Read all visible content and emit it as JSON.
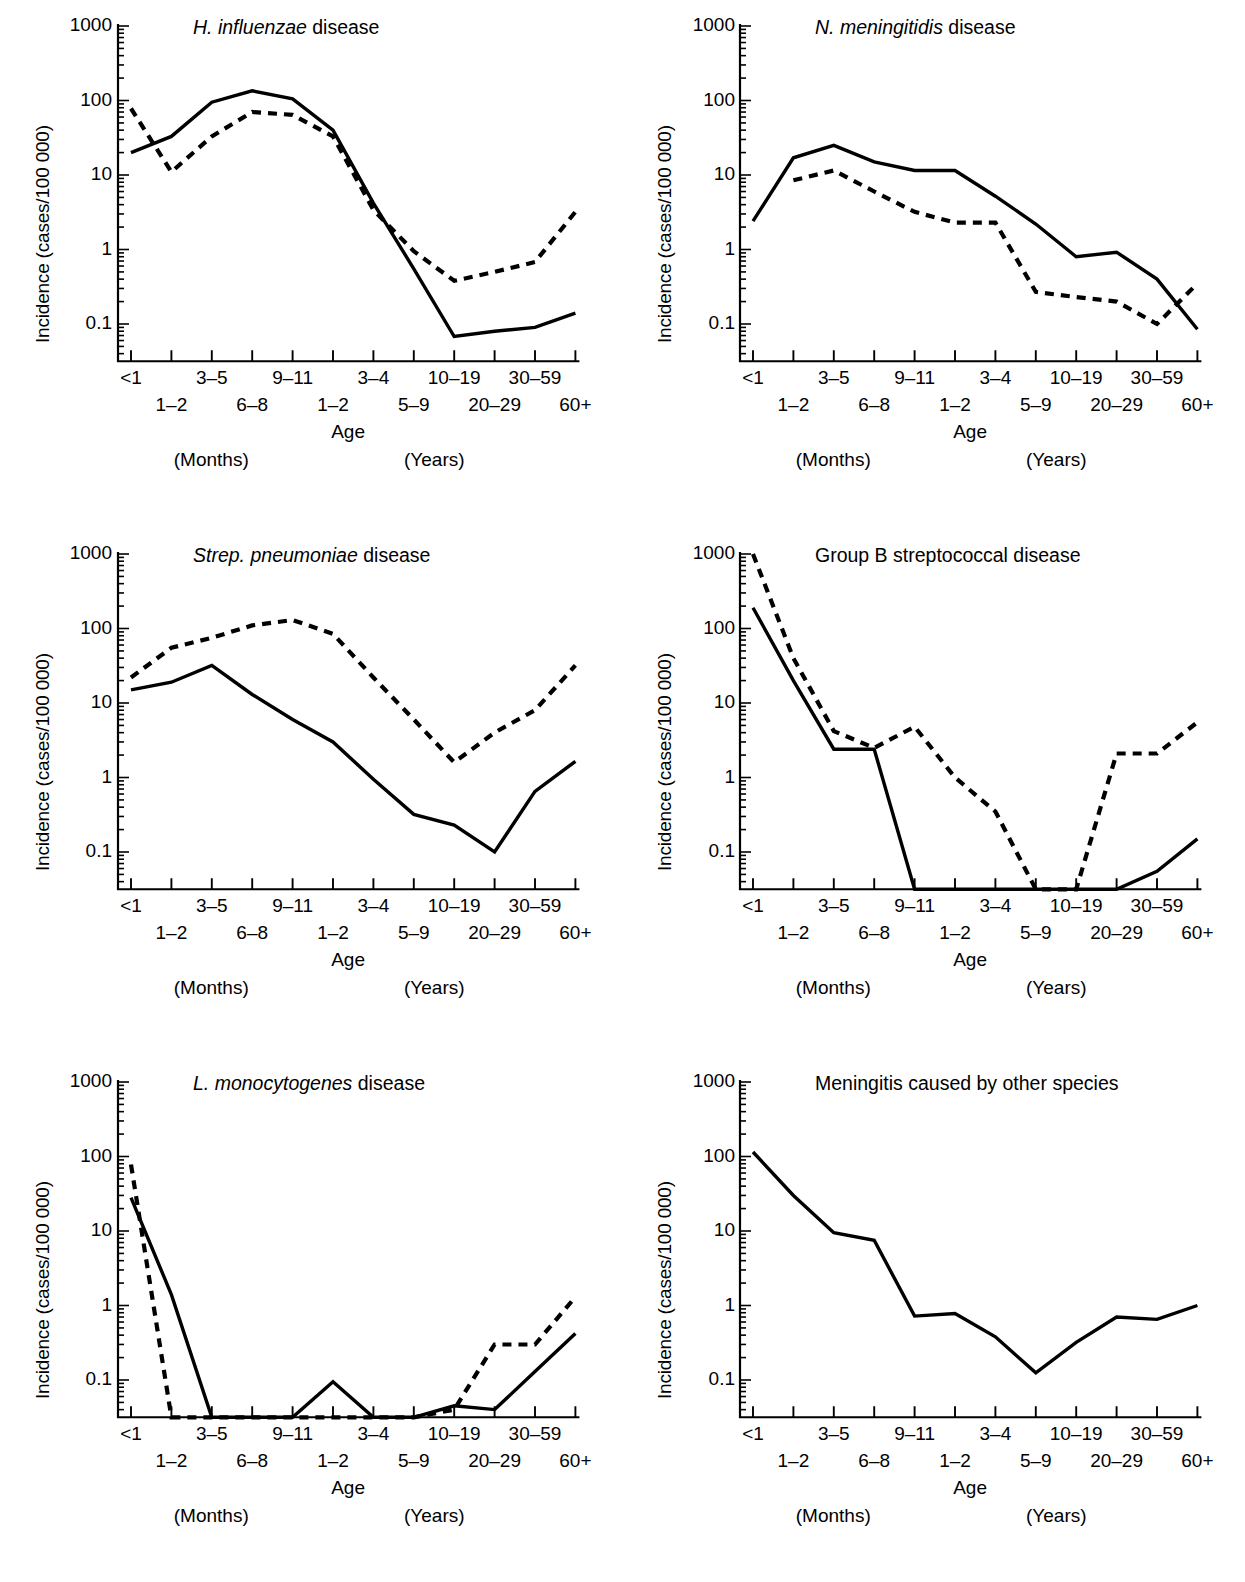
{
  "figure": {
    "axis_label_y": "Incidence (cases/100 000)",
    "axis_label_x": "Age",
    "months_note": "(Months)",
    "years_note": "(Years)",
    "y_tick_labels": [
      "1000",
      "100",
      "10",
      "1",
      "0.1"
    ],
    "x_tick_labels_top": [
      "<1",
      "3–5",
      "9–11",
      "3–4",
      "10–19",
      "30–59"
    ],
    "x_tick_labels_bottom": [
      "1–2",
      "6–8",
      "1–2",
      "5–9",
      "20–29",
      "60+"
    ],
    "line_color": "#000000",
    "solid_series_name": "solid",
    "dashed_series_name": "dashed"
  },
  "chart_data": [
    {
      "type": "line",
      "title": "H. influenzae disease",
      "title_italic_part": "H. influenzae",
      "title_roman_part": " disease",
      "xlabel": "Age",
      "ylabel": "Incidence (cases/100 000)",
      "ylim": [
        0.032,
        1000
      ],
      "yscale": "log",
      "grid": false,
      "legend": "none",
      "categories": [
        "<1",
        "1–2",
        "3–5",
        "6–8",
        "9–11",
        "1–2",
        "3–4",
        "5–9",
        "10–19",
        "20–29",
        "30–59",
        "60+"
      ],
      "series": [
        {
          "name": "solid",
          "style": "solid",
          "values": [
            20,
            33,
            95,
            135,
            105,
            40,
            4.2,
            0.55,
            0.068,
            0.08,
            0.09,
            0.14
          ]
        },
        {
          "name": "dashed",
          "style": "dashed",
          "values": [
            78,
            11,
            33,
            70,
            64,
            33,
            3.4,
            0.95,
            0.38,
            0.5,
            0.68,
            3.2
          ]
        }
      ]
    },
    {
      "type": "line",
      "title": "N. meningitidis disease",
      "title_italic_part": "N. meningitidis",
      "title_roman_part": " disease",
      "xlabel": "Age",
      "ylabel": "Incidence (cases/100 000)",
      "ylim": [
        0.032,
        1000
      ],
      "yscale": "log",
      "grid": false,
      "legend": "none",
      "categories": [
        "<1",
        "1–2",
        "3–5",
        "6–8",
        "9–11",
        "1–2",
        "3–4",
        "5–9",
        "10–19",
        "20–29",
        "30–59",
        "60+"
      ],
      "series": [
        {
          "name": "solid",
          "style": "solid",
          "values": [
            2.4,
            17,
            25,
            15,
            11.5,
            11.5,
            5.2,
            2.2,
            0.8,
            0.92,
            0.4,
            0.085
          ]
        },
        {
          "name": "dashed",
          "style": "dashed",
          "values": [
            null,
            8.5,
            11.5,
            6.0,
            3.2,
            2.3,
            2.3,
            0.27,
            0.23,
            0.2,
            0.1,
            0.35
          ]
        }
      ]
    },
    {
      "type": "line",
      "title": "Strep. pneumoniae disease",
      "title_italic_part": "Strep. pneumoniae",
      "title_roman_part": " disease",
      "xlabel": "Age",
      "ylabel": "Incidence (cases/100 000)",
      "ylim": [
        0.032,
        1000
      ],
      "yscale": "log",
      "grid": false,
      "legend": "none",
      "categories": [
        "<1",
        "1–2",
        "3–5",
        "6–8",
        "9–11",
        "1–2",
        "3–4",
        "5–9",
        "10–19",
        "20–29",
        "30–59",
        "60+"
      ],
      "series": [
        {
          "name": "solid",
          "style": "solid",
          "values": [
            15,
            19,
            32,
            13,
            6.0,
            3.0,
            0.95,
            0.32,
            0.23,
            0.1,
            0.65,
            1.65
          ]
        },
        {
          "name": "dashed",
          "style": "dashed",
          "values": [
            22,
            55,
            75,
            110,
            130,
            85,
            22,
            6.0,
            1.6,
            4.0,
            8.0,
            32
          ]
        }
      ]
    },
    {
      "type": "line",
      "title": "Group B streptococcal disease",
      "title_italic_part": "",
      "title_roman_part": "Group B streptococcal disease",
      "xlabel": "Age",
      "ylabel": "Incidence (cases/100 000)",
      "ylim": [
        0.032,
        1000
      ],
      "yscale": "log",
      "grid": false,
      "legend": "none",
      "categories": [
        "<1",
        "1–2",
        "3–5",
        "6–8",
        "9–11",
        "1–2",
        "3–4",
        "5–9",
        "10–19",
        "20–29",
        "30–59",
        "60+"
      ],
      "series": [
        {
          "name": "solid",
          "style": "solid",
          "values": [
            190,
            20,
            2.4,
            2.4,
            0,
            0,
            0,
            0,
            0,
            0,
            0.055,
            0.15
          ]
        },
        {
          "name": "dashed",
          "style": "dashed",
          "values": [
            1000,
            40,
            4.2,
            2.5,
            4.8,
            1.0,
            0.35,
            0,
            0,
            2.1,
            2.1,
            5.5
          ]
        }
      ]
    },
    {
      "type": "line",
      "title": "L. monocytogenes disease",
      "title_italic_part": "L. monocytogenes",
      "title_roman_part": " disease",
      "xlabel": "Age",
      "ylabel": "Incidence (cases/100 000)",
      "ylim": [
        0.032,
        1000
      ],
      "yscale": "log",
      "grid": false,
      "legend": "none",
      "categories": [
        "<1",
        "1–2",
        "3–5",
        "6–8",
        "9–11",
        "1–2",
        "3–4",
        "5–9",
        "10–19",
        "20–29",
        "30–59",
        "60+"
      ],
      "series": [
        {
          "name": "solid",
          "style": "solid",
          "values": [
            28,
            1.4,
            0,
            0,
            0,
            0.095,
            0,
            0,
            0.045,
            0.04,
            0.13,
            0.42
          ]
        },
        {
          "name": "dashed",
          "style": "dashed",
          "values": [
            78,
            0,
            0,
            0,
            0,
            0,
            0,
            0,
            0.04,
            0.3,
            0.3,
            1.3
          ]
        }
      ]
    },
    {
      "type": "line",
      "title": "Meningitis caused by other species",
      "title_italic_part": "",
      "title_roman_part": "Meningitis caused by other species",
      "xlabel": "Age",
      "ylabel": "Incidence (cases/100 000)",
      "ylim": [
        0.032,
        1000
      ],
      "yscale": "log",
      "grid": false,
      "legend": "none",
      "categories": [
        "<1",
        "1–2",
        "3–5",
        "6–8",
        "9–11",
        "1–2",
        "3–4",
        "5–9",
        "10–19",
        "20–29",
        "30–59",
        "60+"
      ],
      "series": [
        {
          "name": "solid",
          "style": "solid",
          "values": [
            115,
            30,
            9.5,
            7.5,
            0.72,
            0.78,
            0.38,
            0.125,
            0.32,
            0.7,
            0.65,
            1.0
          ]
        }
      ]
    }
  ]
}
